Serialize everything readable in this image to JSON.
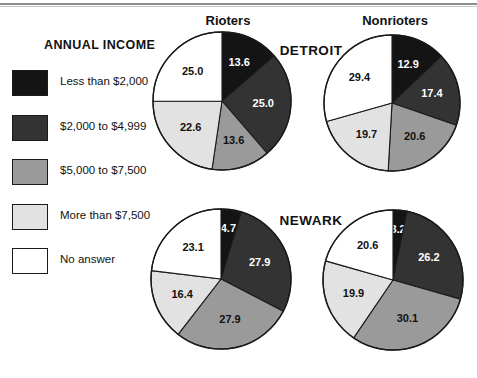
{
  "figure": {
    "legend_title": "ANNUAL INCOME",
    "has_top_rule": true
  },
  "legend": {
    "items": [
      {
        "label": "Less than $2,000",
        "color": "#141414",
        "key": "lt2000"
      },
      {
        "label": "$2,000 to $4,999",
        "color": "#333333",
        "key": "2000to4999"
      },
      {
        "label": "$5,000 to $7,500",
        "color": "#9a9a9a",
        "key": "5000to7500"
      },
      {
        "label": "More than $7,500",
        "color": "#e2e2e2",
        "key": "gt7500"
      },
      {
        "label": "No answer",
        "color": "#ffffff",
        "key": "noanswer"
      }
    ]
  },
  "column_headers": [
    {
      "label": "Rioters",
      "cx": 228
    },
    {
      "label": "Nonrioters",
      "cx": 395
    }
  ],
  "row_headers": [
    {
      "label": "DETROIT",
      "cx": 311,
      "cy": 43
    },
    {
      "label": "NEWARK",
      "cx": 311,
      "cy": 213
    }
  ],
  "chart_data": {
    "type": "pie",
    "title": "ANNUAL INCOME",
    "categories": [
      "Less than $2,000",
      "$2,000 to $4,999",
      "$5,000 to $7,500",
      "More than $7,500",
      "No answer"
    ],
    "colors": [
      "#141414",
      "#333333",
      "#9a9a9a",
      "#e2e2e2",
      "#ffffff"
    ],
    "label_colors": [
      "#ffffff",
      "#ffffff",
      "#111111",
      "#111111",
      "#111111"
    ],
    "units": "percent",
    "start_angle_deg": 0,
    "direction": "clockwise",
    "legend_position": "left",
    "charts": [
      {
        "city": "DETROIT",
        "group": "Rioters",
        "cx": 222,
        "cy": 101,
        "r": 69,
        "values": [
          13.6,
          25.0,
          13.6,
          22.6,
          25.0
        ],
        "labels": [
          "13.6",
          "25.0",
          "13.6",
          "22.6",
          "25.0"
        ]
      },
      {
        "city": "DETROIT",
        "group": "Nonrioters",
        "cx": 392,
        "cy": 103,
        "r": 68,
        "values": [
          12.9,
          17.4,
          20.6,
          19.7,
          29.4
        ],
        "labels": [
          "12.9",
          "17.4",
          "20.6",
          "19.7",
          "29.4"
        ]
      },
      {
        "city": "NEWARK",
        "group": "Rioters",
        "cx": 221,
        "cy": 279,
        "r": 70,
        "values": [
          4.7,
          27.9,
          27.9,
          16.4,
          23.1
        ],
        "labels": [
          "4.7",
          "27.9",
          "27.9",
          "16.4",
          "23.1"
        ]
      },
      {
        "city": "NEWARK",
        "group": "Nonrioters",
        "cx": 393,
        "cy": 280,
        "r": 70,
        "values": [
          3.2,
          26.2,
          30.1,
          19.9,
          20.6
        ],
        "labels": [
          "3.2",
          "26.2",
          "30.1",
          "19.9",
          "20.6"
        ]
      }
    ]
  }
}
